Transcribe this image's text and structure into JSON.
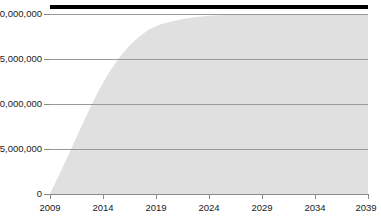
{
  "chart_data": {
    "type": "area",
    "title": "",
    "subtitle": "",
    "xlabel": "",
    "ylabel": "",
    "xlim": [
      2009,
      2041
    ],
    "ylim": [
      0,
      20000000
    ],
    "grid": true,
    "legend": "none",
    "x_ticks": [
      2009,
      2014,
      2019,
      2024,
      2029,
      2034,
      2039
    ],
    "x_tick_labels": [
      "2009",
      "2014",
      "2019",
      "2024",
      "2029",
      "2034",
      "2039"
    ],
    "y_ticks": [
      0,
      5000000,
      10000000,
      15000000,
      20000000
    ],
    "y_tick_labels": [
      "0",
      "5,000,000",
      "10,000,000",
      "15,000,000",
      "20,000,000"
    ],
    "series": [
      {
        "name": "cumulative-area",
        "type": "area",
        "fill_color": "#e0e0e0",
        "x": [
          2009,
          2010,
          2011,
          2012,
          2013,
          2014,
          2015,
          2016,
          2017,
          2018,
          2019,
          2020,
          2021,
          2022,
          2023,
          2024,
          2025,
          2026,
          2027,
          2028,
          2029,
          2030,
          2031,
          2032,
          2033,
          2034,
          2035,
          2036,
          2037,
          2038,
          2039,
          2040,
          2041
        ],
        "values": [
          0,
          2300000,
          4700000,
          7100000,
          9500000,
          11700000,
          13600000,
          15200000,
          16500000,
          17500000,
          18300000,
          18800000,
          19100000,
          19350000,
          19550000,
          19700000,
          19800000,
          19870000,
          19920000,
          19950000,
          19970000,
          19980000,
          19990000,
          19995000,
          20000000,
          20000000,
          20000000,
          20000000,
          20000000,
          20000000,
          20000000,
          20000000,
          20000000
        ]
      },
      {
        "name": "reference-line",
        "type": "line",
        "line_color": "#000000",
        "line_width": 4,
        "x": [
          2009,
          2041
        ],
        "values": [
          21000000,
          21000000
        ]
      }
    ]
  },
  "axes": {
    "y_labels": [
      "20,000,000",
      "15,000,000",
      "10,000,000",
      "5,000,000",
      "0"
    ],
    "x_labels": [
      "2009",
      "2014",
      "2019",
      "2024",
      "2029",
      "2034",
      "2039"
    ]
  },
  "colors": {
    "area_fill": "#e0e0e0",
    "gridline": "#999999",
    "axis": "#8a8a8a",
    "reference_line": "#000000",
    "text": "#1a1a1a",
    "background": "#ffffff"
  }
}
